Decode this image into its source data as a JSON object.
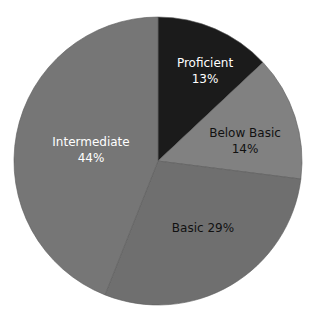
{
  "chart_data": {
    "type": "pie",
    "title": "",
    "categories": [
      "Proficient",
      "Below Basic",
      "Basic",
      "Intermediate"
    ],
    "values": [
      13,
      14,
      29,
      44
    ],
    "unit": "%",
    "start_angle_deg": 0,
    "direction": "clockwise",
    "legend": "none (direct labels)",
    "slices": [
      {
        "label": "Proficient",
        "value": 13,
        "display": "13%",
        "color": "#1b1b1b",
        "text_color": "#ffffff"
      },
      {
        "label": "Below Basic",
        "value": 14,
        "display": "14%",
        "color": "#818181",
        "text_color": "#111111"
      },
      {
        "label": "Basic",
        "value": 29,
        "display": "29%",
        "color": "#6f6f6f",
        "text_color": "#111111"
      },
      {
        "label": "Intermediate",
        "value": 44,
        "display": "44%",
        "color": "#767676",
        "text_color": "#ffffff"
      }
    ]
  },
  "labels": {
    "proficient": {
      "name": "Proficient",
      "pct": "13%"
    },
    "below_basic": {
      "name": "Below Basic",
      "pct": "14%"
    },
    "basic": {
      "text": "Basic 29%"
    },
    "intermediate": {
      "name": "Intermediate",
      "pct": "44%"
    }
  }
}
